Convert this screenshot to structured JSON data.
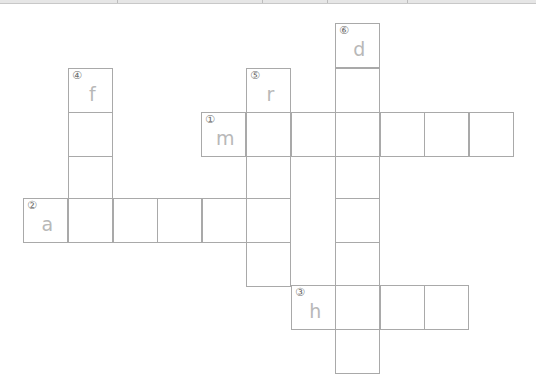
{
  "app": {
    "toolbar_separators_x": [
      117,
      262,
      327,
      407
    ]
  },
  "colors": {
    "cell_border": "#a9a9a9",
    "letter": "#b8b8b8",
    "clue_number": "#6f6f6f",
    "background": "#ffffff"
  },
  "crossword": {
    "cell_size": 44.6,
    "clues": [
      {
        "number": "①",
        "direction": "across",
        "start_letter": "m",
        "length": 7
      },
      {
        "number": "②",
        "direction": "across",
        "start_letter": "a",
        "length": 6
      },
      {
        "number": "③",
        "direction": "across",
        "start_letter": "h",
        "length": 4
      },
      {
        "number": "④",
        "direction": "down",
        "start_letter": "f",
        "length": 4
      },
      {
        "number": "⑤",
        "direction": "down",
        "start_letter": "r",
        "length": 5
      },
      {
        "number": "⑥",
        "direction": "down",
        "start_letter": "d",
        "length": 8
      }
    ],
    "cells": [
      {
        "x": 335,
        "y": 23,
        "num": "⑥",
        "letter": "d"
      },
      {
        "x": 335,
        "y": 68,
        "num": "",
        "letter": ""
      },
      {
        "x": 335,
        "y": 112,
        "num": "",
        "letter": ""
      },
      {
        "x": 335,
        "y": 156,
        "num": "",
        "letter": ""
      },
      {
        "x": 335,
        "y": 198,
        "num": "",
        "letter": ""
      },
      {
        "x": 335,
        "y": 242,
        "num": "",
        "letter": ""
      },
      {
        "x": 335,
        "y": 285,
        "num": "",
        "letter": ""
      },
      {
        "x": 335,
        "y": 329,
        "num": "",
        "letter": ""
      },
      {
        "x": 68,
        "y": 68,
        "num": "④",
        "letter": "f"
      },
      {
        "x": 68,
        "y": 112,
        "num": "",
        "letter": ""
      },
      {
        "x": 68,
        "y": 156,
        "num": "",
        "letter": ""
      },
      {
        "x": 246,
        "y": 68,
        "num": "⑤",
        "letter": "r"
      },
      {
        "x": 246,
        "y": 112,
        "num": "",
        "letter": ""
      },
      {
        "x": 246,
        "y": 156,
        "num": "",
        "letter": ""
      },
      {
        "x": 246,
        "y": 198,
        "num": "",
        "letter": ""
      },
      {
        "x": 246,
        "y": 242,
        "num": "",
        "letter": ""
      },
      {
        "x": 201,
        "y": 112,
        "num": "①",
        "letter": "m"
      },
      {
        "x": 291,
        "y": 112,
        "num": "",
        "letter": ""
      },
      {
        "x": 380,
        "y": 112,
        "num": "",
        "letter": ""
      },
      {
        "x": 424,
        "y": 112,
        "num": "",
        "letter": ""
      },
      {
        "x": 469,
        "y": 112,
        "num": "",
        "letter": ""
      },
      {
        "x": 23,
        "y": 198,
        "num": "②",
        "letter": "a"
      },
      {
        "x": 68,
        "y": 198,
        "num": "",
        "letter": ""
      },
      {
        "x": 113,
        "y": 198,
        "num": "",
        "letter": ""
      },
      {
        "x": 157,
        "y": 198,
        "num": "",
        "letter": ""
      },
      {
        "x": 202,
        "y": 198,
        "num": "",
        "letter": ""
      },
      {
        "x": 291,
        "y": 285,
        "num": "③",
        "letter": "h"
      },
      {
        "x": 380,
        "y": 285,
        "num": "",
        "letter": ""
      },
      {
        "x": 424,
        "y": 285,
        "num": "",
        "letter": ""
      }
    ]
  }
}
